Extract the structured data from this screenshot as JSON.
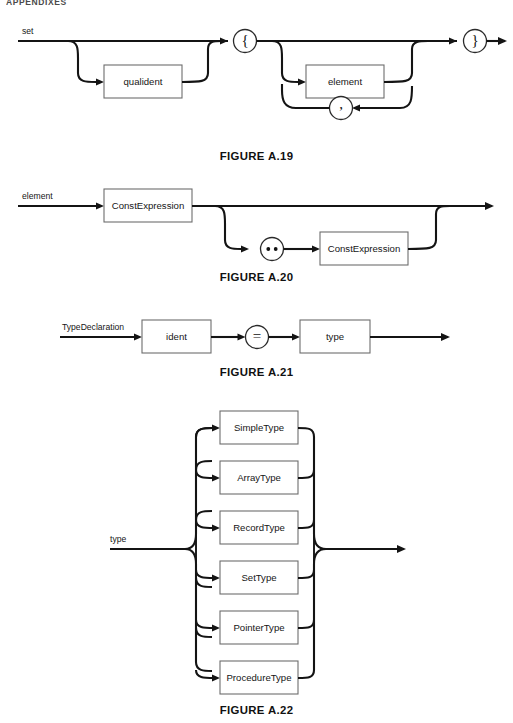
{
  "page": {
    "running_head": "APPENDIXES",
    "width": 513,
    "height": 723,
    "background": "#ffffff",
    "ink_color": "#141414",
    "box_stroke": "#6d6d6d"
  },
  "figures": [
    {
      "id": "a19",
      "caption": "FIGURE A.19",
      "rule_name": "set",
      "entry_label": "set",
      "boxes": [
        {
          "label": "qualident",
          "kind": "nonterminal"
        },
        {
          "label": "element",
          "kind": "nonterminal"
        }
      ],
      "terminals": [
        {
          "label": "{",
          "kind": "terminal"
        },
        {
          "label": "}",
          "kind": "terminal"
        },
        {
          "label": ",",
          "kind": "terminal"
        }
      ]
    },
    {
      "id": "a20",
      "caption": "FIGURE A.20",
      "rule_name": "element",
      "entry_label": "element",
      "boxes": [
        {
          "label": "ConstExpression",
          "kind": "nonterminal"
        },
        {
          "label": "ConstExpression",
          "kind": "nonterminal"
        }
      ],
      "terminals": [
        {
          "label": "..",
          "kind": "terminal"
        }
      ]
    },
    {
      "id": "a21",
      "caption": "FIGURE A.21",
      "rule_name": "TypeDeclaration",
      "entry_label": "TypeDeclaration",
      "boxes": [
        {
          "label": "ident",
          "kind": "nonterminal"
        },
        {
          "label": "type",
          "kind": "nonterminal"
        }
      ],
      "terminals": [
        {
          "label": "=",
          "kind": "terminal"
        }
      ]
    },
    {
      "id": "a22",
      "caption": "FIGURE A.22",
      "rule_name": "type",
      "entry_label": "type",
      "boxes": [
        {
          "label": "SimpleType",
          "kind": "nonterminal"
        },
        {
          "label": "ArrayType",
          "kind": "nonterminal"
        },
        {
          "label": "RecordType",
          "kind": "nonterminal"
        },
        {
          "label": "SetType",
          "kind": "nonterminal"
        },
        {
          "label": "PointerType",
          "kind": "nonterminal"
        },
        {
          "label": "ProcedureType",
          "kind": "nonterminal"
        }
      ],
      "terminals": []
    }
  ]
}
